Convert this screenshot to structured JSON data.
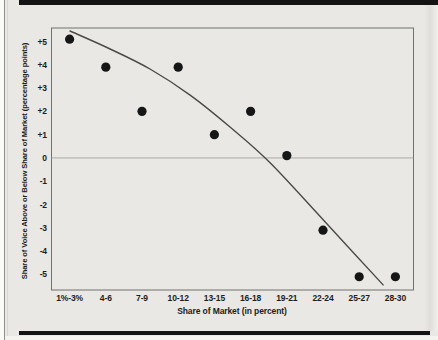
{
  "page": {
    "background_color": "#e9e8e4",
    "rule_bar_color": "#141414"
  },
  "chart_data": {
    "type": "scatter",
    "title": "",
    "xlabel": "Share of Market (in percent)",
    "ylabel": "Share of Voice Above or Below Share of Market (percentage points)",
    "categories": [
      "1%-3%",
      "4-6",
      "7-9",
      "10-12",
      "13-15",
      "16-18",
      "19-21",
      "22-24",
      "25-27",
      "28-30"
    ],
    "y_ticks": [
      "+5",
      "+4",
      "+3",
      "+2",
      "+1",
      "0",
      "-1",
      "-2",
      "-3",
      "-4",
      "-5"
    ],
    "y_tick_values": [
      5,
      4,
      3,
      2,
      1,
      0,
      -1,
      -2,
      -3,
      -4,
      -5
    ],
    "ylim": [
      -5.67,
      5.58
    ],
    "grid": "zero-line-only",
    "legend": "none",
    "points": [
      {
        "category": "1%-3%",
        "value": 5.1
      },
      {
        "category": "4-6",
        "value": 3.9
      },
      {
        "category": "7-9",
        "value": 2.0
      },
      {
        "category": "10-12",
        "value": 3.9
      },
      {
        "category": "13-15",
        "value": 1.0
      },
      {
        "category": "16-18",
        "value": 2.0
      },
      {
        "category": "19-21",
        "value": 0.1
      },
      {
        "category": "22-24",
        "value": -3.1
      },
      {
        "category": "25-27",
        "value": -5.1
      },
      {
        "category": "28-30",
        "value": -5.1
      }
    ],
    "trendline": {
      "shape": "smooth concave-down fitted curve",
      "points_index_value": [
        [
          0.01,
          5.45
        ],
        [
          1.12,
          4.68
        ],
        [
          2.22,
          3.82
        ],
        [
          3.33,
          2.7
        ],
        [
          4.43,
          1.33
        ],
        [
          5.54,
          -0.21
        ],
        [
          7.03,
          -2.7
        ],
        [
          8.66,
          -5.45
        ]
      ]
    },
    "zero_line": true,
    "dot_color": "#161616",
    "curve_color": "#4a4a47",
    "frame_color": "#70706c",
    "zero_line_color": "#9c9c98"
  }
}
